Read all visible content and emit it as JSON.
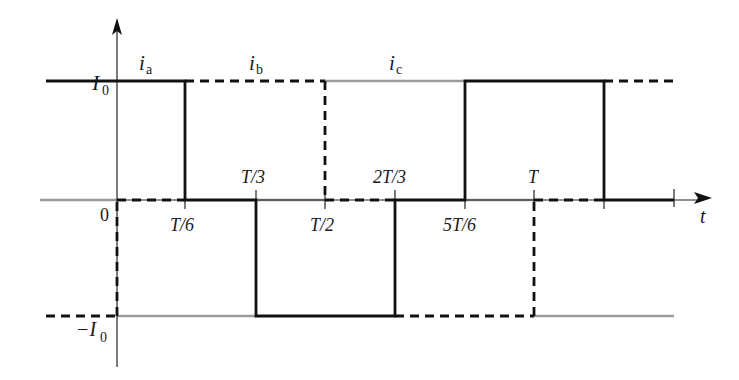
{
  "diagram": {
    "title": "",
    "axis": {
      "x_label": "t",
      "y_ticks": {
        "top": "I",
        "top_sub": "0",
        "bottom_prefix": "−I",
        "bottom_sub": "0"
      },
      "origin_label": "0"
    },
    "x_ticks_above": [
      {
        "num": "T",
        "den": "3",
        "label": "T/3"
      },
      {
        "num": "2T",
        "den": "3",
        "label": "2T/3"
      },
      {
        "num": "T",
        "den": "",
        "label": "T"
      }
    ],
    "x_ticks_below": [
      {
        "label": "T/6"
      },
      {
        "label": "T/2"
      },
      {
        "label": "5T/6"
      }
    ],
    "series": [
      {
        "name": "i",
        "sub": "a",
        "style": "solid black",
        "color": "#111111",
        "waveform": [
          {
            "t_start": "-T/6",
            "t_end": "T/6",
            "value": "I0"
          },
          {
            "t_start": "T/6",
            "t_end": "T/3",
            "value": "0"
          },
          {
            "t_start": "T/3",
            "t_end": "2T/3",
            "value": "-I0"
          },
          {
            "t_start": "2T/3",
            "t_end": "5T/6",
            "value": "0"
          },
          {
            "t_start": "5T/6",
            "t_end": "7T/6",
            "value": "I0"
          },
          {
            "t_start": "7T/6",
            "t_end": "4T/3",
            "value": "0"
          }
        ]
      },
      {
        "name": "i",
        "sub": "b",
        "style": "dashed black",
        "color": "#111111",
        "waveform": [
          {
            "t_start": "-T/6",
            "t_end": "0",
            "value": "-I0"
          },
          {
            "t_start": "0",
            "t_end": "T/6",
            "value": "0"
          },
          {
            "t_start": "T/6",
            "t_end": "T/2",
            "value": "I0"
          },
          {
            "t_start": "T/2",
            "t_end": "2T/3",
            "value": "0"
          },
          {
            "t_start": "2T/3",
            "t_end": "T",
            "value": "-I0"
          },
          {
            "t_start": "T",
            "t_end": "7T/6",
            "value": "0"
          },
          {
            "t_start": "7T/6",
            "t_end": "3T/2",
            "value": "I0"
          }
        ]
      },
      {
        "name": "i",
        "sub": "c",
        "style": "solid gray",
        "color": "#9a9a9a",
        "waveform": [
          {
            "t_start": "-T/6",
            "t_end": "0",
            "value": "0"
          },
          {
            "t_start": "0",
            "t_end": "T/3",
            "value": "-I0"
          },
          {
            "t_start": "T/3",
            "t_end": "T/2",
            "value": "0"
          },
          {
            "t_start": "T/2",
            "t_end": "5T/6",
            "value": "I0"
          },
          {
            "t_start": "5T/6",
            "t_end": "T",
            "value": "0"
          },
          {
            "t_start": "T",
            "t_end": "4T/3",
            "value": "-I0"
          }
        ]
      }
    ]
  }
}
